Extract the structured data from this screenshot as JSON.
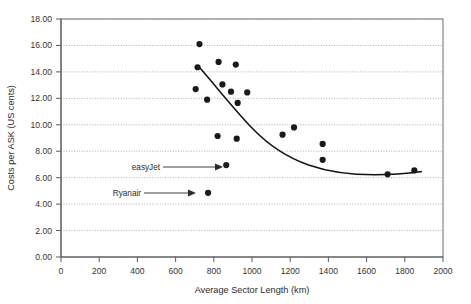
{
  "chart_data": {
    "type": "scatter",
    "title": "",
    "xlabel": "Average Sector Length (km)",
    "ylabel": "Costs per ASK (US cents)",
    "xlim": [
      0,
      2000
    ],
    "ylim": [
      0,
      18
    ],
    "xticks": [
      "0",
      "200",
      "400",
      "600",
      "800",
      "1000",
      "1200",
      "1400",
      "1600",
      "1800",
      "2000"
    ],
    "yticks": [
      "0.00",
      "2.00",
      "4.00",
      "6.00",
      "8.00",
      "10.00",
      "12.00",
      "14.00",
      "16.00",
      "18.00"
    ],
    "grid": "horizontal-dotted",
    "legend": "none",
    "marker_color": "#1a1a1a",
    "curve_color": "#111111",
    "points": [
      {
        "x": 725,
        "y": 16.1
      },
      {
        "x": 715,
        "y": 14.35
      },
      {
        "x": 825,
        "y": 14.75
      },
      {
        "x": 915,
        "y": 14.55
      },
      {
        "x": 705,
        "y": 12.7
      },
      {
        "x": 845,
        "y": 13.05
      },
      {
        "x": 765,
        "y": 11.9
      },
      {
        "x": 890,
        "y": 12.5
      },
      {
        "x": 975,
        "y": 12.45
      },
      {
        "x": 925,
        "y": 11.65
      },
      {
        "x": 1220,
        "y": 9.8
      },
      {
        "x": 1160,
        "y": 9.25
      },
      {
        "x": 820,
        "y": 9.15
      },
      {
        "x": 920,
        "y": 8.95
      },
      {
        "x": 1370,
        "y": 8.55
      },
      {
        "x": 1370,
        "y": 7.35
      },
      {
        "x": 865,
        "y": 6.95
      },
      {
        "x": 1850,
        "y": 6.55
      },
      {
        "x": 1710,
        "y": 6.25
      },
      {
        "x": 770,
        "y": 4.85
      }
    ],
    "trend_curve": {
      "description": "fitted declining cost curve",
      "from_x": 725,
      "to_x": 1890,
      "from_y": 14.3,
      "to_y": 6.5
    },
    "annotations": [
      {
        "label": "easyJet",
        "target_x": 865,
        "target_y": 6.95
      },
      {
        "label": "Ryanair",
        "target_x": 770,
        "target_y": 4.85
      }
    ]
  }
}
